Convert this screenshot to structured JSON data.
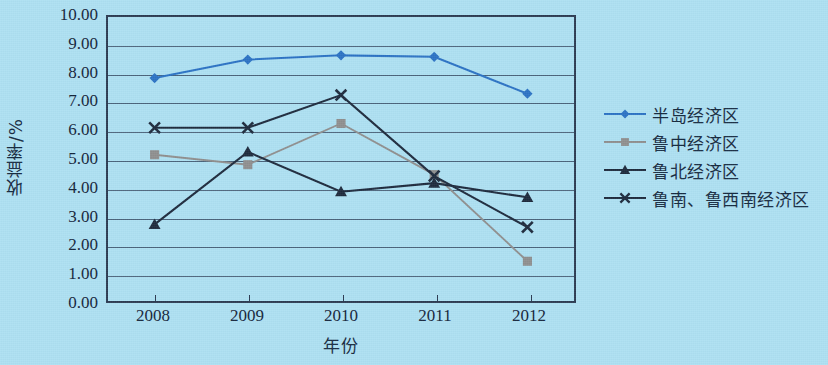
{
  "chart_data": {
    "type": "line",
    "title": "",
    "xlabel": "年份",
    "ylabel": "收益率/%",
    "categories": [
      "2008",
      "2009",
      "2010",
      "2011",
      "2012"
    ],
    "ylim": [
      0,
      10
    ],
    "ytick_step": 1,
    "ytick_labels": [
      "10.00",
      "9.00",
      "8.00",
      "7.00",
      "6.00",
      "5.00",
      "4.00",
      "3.00",
      "2.00",
      "1.00",
      "0.00"
    ],
    "grid": true,
    "legend_position": "right",
    "series": [
      {
        "name": "半岛经济区",
        "marker": "diamond",
        "color": "#2b72c4",
        "values": [
          7.85,
          8.5,
          8.65,
          8.6,
          7.3
        ]
      },
      {
        "name": "鲁中经济区",
        "marker": "square",
        "color": "#8f8f8f",
        "values": [
          5.15,
          4.8,
          6.25,
          4.45,
          1.4
        ]
      },
      {
        "name": "鲁北经济区",
        "marker": "triangle",
        "color": "#1d2a3d",
        "values": [
          2.7,
          5.25,
          3.85,
          4.15,
          3.65
        ]
      },
      {
        "name": "鲁南、鲁西南经济区",
        "marker": "cross",
        "color": "#1d2a3d",
        "values": [
          6.1,
          6.1,
          7.25,
          4.4,
          2.6
        ]
      }
    ]
  },
  "colors": {
    "background": "#ade0f2",
    "axis": "#2b3b52",
    "gridline": "#3a4e66",
    "text": "#13243a"
  }
}
